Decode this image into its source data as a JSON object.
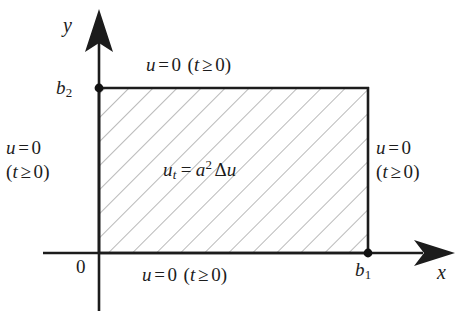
{
  "figure": {
    "kind": "math-diagram",
    "background_color": "#ffffff",
    "ink_color": "#1c1c1c"
  },
  "axes": {
    "x_label": "x",
    "y_label": "y",
    "origin_label": "0",
    "x_tick_label": "b",
    "x_tick_sub": "1",
    "y_tick_label": "b",
    "y_tick_sub": "2",
    "arrow_style": "solid-triangle"
  },
  "domain_rect": {
    "fill": "hatched",
    "hatch_angle_deg": -45,
    "hatch_spacing_px": 17,
    "hatch_color": "#8c8c8c",
    "border_color": "#1c1c1c",
    "corner_markers": [
      "top-left",
      "bottom-right"
    ]
  },
  "interior": {
    "equation_lhs": "u",
    "equation_lhs_sub": "t",
    "equation_op": "=",
    "equation_coeff": "a",
    "equation_coeff_sup": "2",
    "equation_operator_symbol": "Δ",
    "equation_rhs_var": "u",
    "equation_plain": "u_t = a² Δu"
  },
  "boundary_conditions": {
    "top": {
      "var": "u",
      "op": "=",
      "value": "0",
      "condition_open": "(",
      "condition_var": "t",
      "condition_rel": "≥",
      "condition_value": "0",
      "condition_close": ")",
      "plain": "u = 0 (t ≥ 0)"
    },
    "bottom": {
      "var": "u",
      "op": "=",
      "value": "0",
      "condition_open": "(",
      "condition_var": "t",
      "condition_rel": "≥",
      "condition_value": "0",
      "condition_close": ")",
      "plain": "u = 0 (t ≥ 0)"
    },
    "left": {
      "var": "u",
      "op": "=",
      "value": "0",
      "condition_open": "(",
      "condition_var": "t",
      "condition_rel": "≥",
      "condition_value": "0",
      "condition_close": ")",
      "plain": "u = 0 (t ≥ 0)"
    },
    "right": {
      "var": "u",
      "op": "=",
      "value": "0",
      "condition_open": "(",
      "condition_var": "t",
      "condition_rel": "≥",
      "condition_value": "0",
      "condition_close": ")",
      "plain": "u = 0 (t ≥ 0)"
    }
  }
}
